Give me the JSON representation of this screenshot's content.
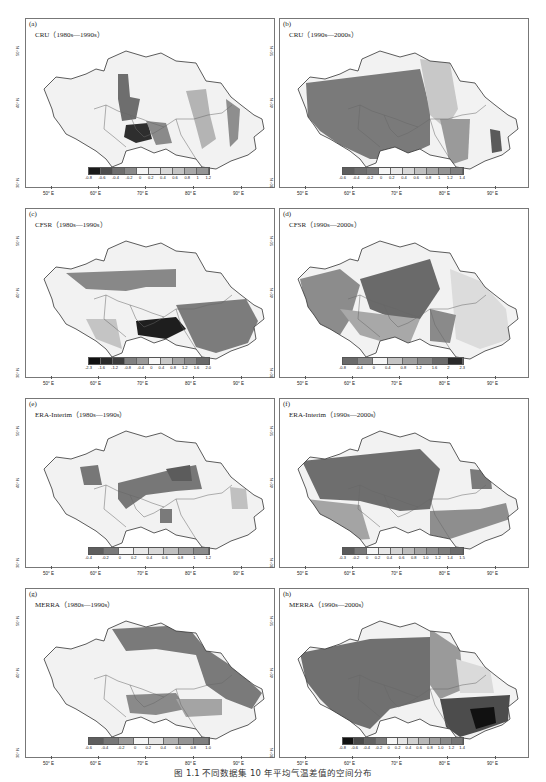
{
  "caption": "图 1.1 不同数据集 10 年平均气温差值的空间分布",
  "axes": {
    "x_ticks": [
      "50° E",
      "60° E",
      "70° E",
      "80° E",
      "90° E"
    ],
    "y_ticks": [
      "50° N",
      "40° N",
      "30° N"
    ]
  },
  "panels": [
    {
      "letter": "(a)",
      "title": "CRU（1980s—1990s）"
    },
    {
      "letter": "(b)",
      "title": "CRU（1990s—2000s）"
    },
    {
      "letter": "(c)",
      "title": "CFSR（1980s—1990s）"
    },
    {
      "letter": "(d)",
      "title": "CFSR（1990s—2000s）"
    },
    {
      "letter": "(e)",
      "title": "ERA-Interim（1980s—1990s）"
    },
    {
      "letter": "(f)",
      "title": "ERA-Interim（1990s—2000s）"
    },
    {
      "letter": "(g)",
      "title": "MERRA（1980s—1990s）"
    },
    {
      "letter": "(h)",
      "title": "MERRA（1990s—2000s）"
    }
  ],
  "chart_data": [
    {
      "type": "heatmap",
      "title": "CRU（1980s—1990s）",
      "panel": "(a)",
      "xlabel": "Longitude",
      "ylabel": "Latitude",
      "xlim": [
        "50° E",
        "95° E"
      ],
      "ylim": [
        "30° N",
        "55° N"
      ],
      "colorbar": [
        "-0.8",
        "-0.6",
        "-0.4",
        "-0.2",
        "0",
        "0.2",
        "0.4",
        "0.6",
        "0.8",
        "1",
        "1.2"
      ],
      "colors": [
        "#1a1a1a",
        "#4d4d4d",
        "#6e6e6e",
        "#8a8a8a",
        "#f4f4f4",
        "#e8e8e8",
        "#d8d8d8",
        "#c4c4c4",
        "#a8a8a8",
        "#959595"
      ]
    },
    {
      "type": "heatmap",
      "title": "CRU（1990s—2000s）",
      "panel": "(b)",
      "xlabel": "Longitude",
      "ylabel": "Latitude",
      "colorbar": [
        "-0.6",
        "-0.4",
        "-0.2",
        "0",
        "0.2",
        "0.4",
        "0.6",
        "0.8",
        "1",
        "1.2",
        "1.4"
      ],
      "colors": [
        "#5e5e5e",
        "#6e6e6e",
        "#7a7a7a",
        "#f4f4f4",
        "#e8e8e8",
        "#d8d8d8",
        "#c0c0c0",
        "#a8a8a8",
        "#949494",
        "#808080"
      ]
    },
    {
      "type": "heatmap",
      "title": "CFSR（1980s—1990s）",
      "panel": "(c)",
      "xlabel": "Longitude",
      "ylabel": "Latitude",
      "colorbar": [
        "-2.3",
        "-1.6",
        "-1.2",
        "-0.8",
        "-0.4",
        "0",
        "0.4",
        "0.8",
        "1.2",
        "1.6",
        "2.0"
      ],
      "colors": [
        "#111111",
        "#2a2a2a",
        "#3c3c3c",
        "#808080",
        "#9a9a9a",
        "#f6f6f6",
        "#c8c8c8",
        "#a4a4a4",
        "#8c8c8c",
        "#6a6a6a"
      ]
    },
    {
      "type": "heatmap",
      "title": "CFSR（1990s—2000s）",
      "panel": "(d)",
      "xlabel": "Longitude",
      "ylabel": "Latitude",
      "colorbar": [
        "-0.8",
        "-0.4",
        "0",
        "0.4",
        "0.8",
        "1.2",
        "1.6",
        "2",
        "2.3"
      ],
      "colors": [
        "#6a6a6a",
        "#8a8a8a",
        "#f4f4f4",
        "#c4c4c4",
        "#a0a0a0",
        "#888888",
        "#6a6a6a",
        "#2a2a2a"
      ]
    },
    {
      "type": "heatmap",
      "title": "ERA-Interim（1980s—1990s）",
      "panel": "(e)",
      "xlabel": "Longitude",
      "ylabel": "Latitude",
      "colorbar": [
        "-0.4",
        "-0.2",
        "0",
        "0.2",
        "0.4",
        "0.6",
        "0.8",
        "1",
        "1.2"
      ],
      "colors": [
        "#5e5e5e",
        "#7a7a7a",
        "#f4f4f4",
        "#e8e8e8",
        "#d8d8d8",
        "#c0c0c0",
        "#a4a4a4",
        "#8c8c8c"
      ]
    },
    {
      "type": "heatmap",
      "title": "ERA-Interim（1990s—2000s）",
      "panel": "(f)",
      "xlabel": "Longitude",
      "ylabel": "Latitude",
      "colorbar": [
        "-0.3",
        "-0.2",
        "0",
        "0.2",
        "0.4",
        "0.6",
        "0.8",
        "1.0",
        "1.2",
        "1.4",
        "1.5"
      ],
      "colors": [
        "#5a5a5a",
        "#787878",
        "#f4f4f4",
        "#e6e6e6",
        "#d4d4d4",
        "#bdbdbd",
        "#a5a5a5",
        "#909090",
        "#7e7e7e",
        "#6c6c6c"
      ]
    },
    {
      "type": "heatmap",
      "title": "MERRA（1980s—1990s）",
      "panel": "(g)",
      "xlabel": "Longitude",
      "ylabel": "Latitude",
      "colorbar": [
        "-0.6",
        "-0.4",
        "-0.2",
        "0",
        "0.2",
        "0.4",
        "0.6",
        "0.8",
        "1.0"
      ],
      "colors": [
        "#5e5e5e",
        "#777777",
        "#9a9a9a",
        "#f4f4f4",
        "#e4e4e4",
        "#b0b0b0",
        "#949494",
        "#808080"
      ]
    },
    {
      "type": "heatmap",
      "title": "MERRA（1990s—2000s）",
      "panel": "(h)",
      "xlabel": "Longitude",
      "ylabel": "Latitude",
      "colorbar": [
        "-0.8",
        "-0.6",
        "-0.4",
        "-0.2",
        "0",
        "0.2",
        "0.4",
        "0.6",
        "0.8",
        "1.0",
        "1.2",
        "1.4"
      ],
      "colors": [
        "#111111",
        "#4a4a4a",
        "#626262",
        "#7a7a7a",
        "#f4f4f4",
        "#e4e4e4",
        "#d0d0d0",
        "#b8b8b8",
        "#a0a0a0",
        "#8a8a8a",
        "#767676"
      ]
    }
  ]
}
